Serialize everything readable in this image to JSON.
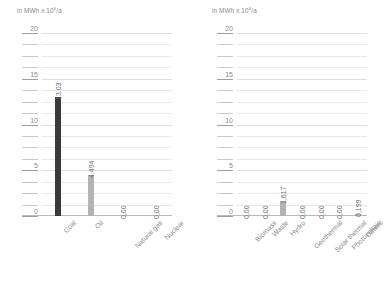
{
  "chart_data": [
    {
      "type": "bar",
      "title": "",
      "unit_caption": "in MWh x 10",
      "unit_exponent": "6",
      "unit_suffix": "/a",
      "xlabel": "",
      "ylabel": "",
      "ylim": [
        0,
        20
      ],
      "yticks": [
        0,
        5,
        10,
        15,
        20
      ],
      "ytick_labels": [
        "0",
        "5",
        "10",
        "15",
        "20"
      ],
      "minor_tick_step": 1.25,
      "grid": true,
      "legend": "none",
      "categories": [
        "Coal",
        "Oil",
        "Natural gas",
        "Nuclear"
      ],
      "values": [
        13.03,
        4.494,
        0.0,
        0.0
      ],
      "value_labels": [
        "13.03",
        "4.494",
        "0,00",
        "0,00"
      ],
      "bar_colors": [
        "#3a3a3a",
        "#b3b3b3",
        "#b3b3b3",
        "#b3b3b3"
      ]
    },
    {
      "type": "bar",
      "title": "",
      "unit_caption": "in MWh x 10",
      "unit_exponent": "6",
      "unit_suffix": "/a",
      "xlabel": "",
      "ylabel": "",
      "ylim": [
        0,
        20
      ],
      "yticks": [
        0,
        5,
        10,
        15,
        20
      ],
      "ytick_labels": [
        "0",
        "5",
        "10",
        "15",
        "20"
      ],
      "minor_tick_step": 1.25,
      "grid": true,
      "legend": "none",
      "categories": [
        "Biomass",
        "Waste",
        "Hydro",
        "Geothermal",
        "Solar thermal",
        "Photovoltaic",
        "Others"
      ],
      "values": [
        0.0,
        0.0,
        1.617,
        0.0,
        0.0,
        0.0,
        0.199
      ],
      "value_labels": [
        "0,00",
        "0,00",
        "1,617",
        "0,00",
        "0,00",
        "0,00",
        "0,199"
      ],
      "bar_colors": [
        "#b3b3b3",
        "#b3b3b3",
        "#b3b3b3",
        "#b3b3b3",
        "#b3b3b3",
        "#b3b3b3",
        "#b3b3b3"
      ]
    }
  ],
  "colors": {
    "background": "#ffffff",
    "grid": "#e8e8e8",
    "axis": "#b9b9b9",
    "text": "#8a8a8a",
    "bar_dark": "#3a3a3a",
    "bar_light": "#b3b3b3"
  }
}
